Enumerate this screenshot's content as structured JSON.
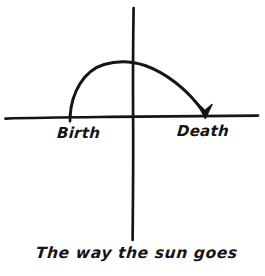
{
  "figure": {
    "kind": "hand-drawn-sketch",
    "background_color": "#ffffff",
    "ink_color": "#151515",
    "caption": "The way the sun goes",
    "labels": {
      "left_label": "Birth",
      "right_label": "Death"
    },
    "axes": {
      "horizontal_icon": "horizontal-axis-line",
      "vertical_icon": "vertical-axis-line",
      "origin_x": 133,
      "origin_y": 117,
      "horizontal_start_x": 5,
      "horizontal_end_x": 258,
      "vertical_start_y": 8,
      "vertical_end_y": 240
    },
    "arc": {
      "icon": "sun-path-arc",
      "start_x": 70,
      "start_y": 117,
      "apex_x": 136,
      "apex_y": 62,
      "end_x": 205,
      "end_y": 114,
      "arrowhead_icon": "arrow-head-down",
      "arrowhead_x": 205,
      "arrowhead_y": 117,
      "direction": "left-to-right"
    },
    "start_marker": {
      "icon": "arc-start-tick",
      "x": 70,
      "y": 117
    }
  }
}
